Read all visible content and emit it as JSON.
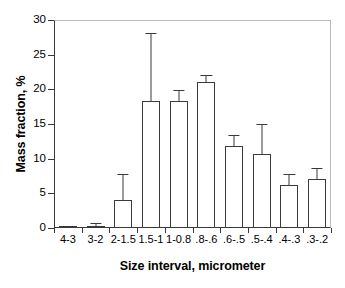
{
  "chart_data": {
    "type": "bar",
    "title": "",
    "xlabel": "Size interval, micrometer",
    "ylabel": "Mass fraction, %",
    "categories": [
      "4-3",
      "3-2",
      "2-1.5",
      "1.5-1",
      "1-0.8",
      ".8-.6",
      ".6-.5",
      ".5-.4",
      ".4-.3",
      ".3-.2"
    ],
    "values": [
      0.05,
      0.3,
      4.1,
      18.3,
      18.3,
      21.1,
      11.8,
      10.7,
      6.2,
      7.1
    ],
    "errors": [
      0.05,
      0.3,
      3.6,
      9.7,
      1.4,
      0.8,
      1.4,
      4.2,
      1.4,
      1.4
    ],
    "error_tops": [
      0.1,
      0.6,
      7.7,
      28.0,
      19.7,
      21.9,
      13.2,
      14.9,
      7.6,
      8.5
    ],
    "ylim": [
      0,
      30
    ],
    "yticks": [
      0,
      5,
      10,
      15,
      20,
      25,
      30
    ],
    "ytick_labels": [
      "0",
      "5",
      "10",
      "15",
      "20",
      "25",
      "30"
    ],
    "grid": false,
    "legend": false,
    "bar_fill_color": "#ffffff",
    "bar_edge_color": "#3a3a3a",
    "axis_color": "#3a3a3a",
    "frame_color": "#b9b9b9",
    "text_color": "#000000"
  }
}
